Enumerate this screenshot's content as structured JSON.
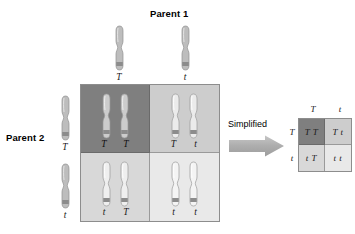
{
  "diagram": {
    "parent1": {
      "title": "Parent 1",
      "gametes": [
        {
          "allele": "T",
          "icon": "chromosome-icon"
        },
        {
          "allele": "t",
          "icon": "chromosome-icon"
        }
      ]
    },
    "parent2": {
      "title": "Parent 2",
      "gametes": [
        {
          "allele": "T",
          "icon": "chromosome-icon"
        },
        {
          "allele": "t",
          "icon": "chromosome-icon"
        }
      ]
    },
    "big_grid": {
      "quadrants": [
        {
          "id": "top-left",
          "left_allele": "T",
          "right_allele": "T",
          "genotype": "TT",
          "shade": "#7f7f7f"
        },
        {
          "id": "top-right",
          "left_allele": "T",
          "right_allele": "t",
          "genotype": "Tt",
          "shade": "#cdcdcd"
        },
        {
          "id": "bottom-left",
          "left_allele": "t",
          "right_allele": "T",
          "genotype": "tT",
          "shade": "#d8d8d8"
        },
        {
          "id": "bottom-right",
          "left_allele": "t",
          "right_allele": "t",
          "genotype": "tt",
          "shade": "#e9e9e9"
        }
      ]
    },
    "transition": {
      "label": "Simplified",
      "icon": "right-arrow-icon",
      "arrow_color": "#b3b3b3"
    },
    "small_grid": {
      "column_headers": [
        "T",
        "t"
      ],
      "row_headers": [
        "T",
        "t"
      ],
      "cells": [
        {
          "id": "top-left",
          "genotype": "T T",
          "shade": "#7f7f7f"
        },
        {
          "id": "top-right",
          "genotype": "T t",
          "shade": "#cdcdcd"
        },
        {
          "id": "bottom-left",
          "genotype": "t T",
          "shade": "#d8d8d8"
        },
        {
          "id": "bottom-right",
          "genotype": "t t",
          "shade": "#e9e9e9"
        }
      ]
    },
    "caption": ""
  }
}
